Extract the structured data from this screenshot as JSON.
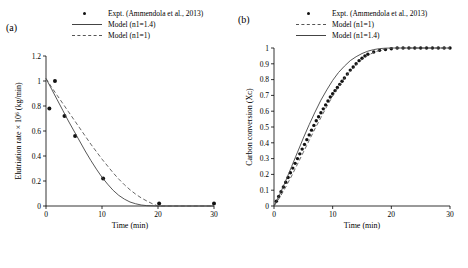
{
  "figure": {
    "panel_a_label": "(a)",
    "panel_b_label": "(b)"
  },
  "legend": {
    "expt": "Expt. (Ammendola et al., 2013)",
    "model_n14": "Model (n1=1.4)",
    "model_n1": "Model (n1=1)"
  },
  "colors": {
    "marker": "#111111",
    "solid_line": "#444444",
    "dashed_line": "#555555",
    "axis": "#000000"
  },
  "chart_data": [
    {
      "type": "line",
      "panel": "a",
      "title": "",
      "xlabel": "Time (min)",
      "ylabel": "Elutriation rate × 10⁶ (kg/min)",
      "xlim": [
        0,
        30
      ],
      "ylim": [
        0,
        1.2
      ],
      "xticks": [
        0,
        10,
        20,
        30
      ],
      "yticks": [
        0,
        0.2,
        0.4,
        0.6,
        0.8,
        1,
        1.2
      ],
      "ytick_labels": [
        "0",
        "0.2",
        "0.4",
        "0.6",
        "0.8",
        "1",
        "1.2"
      ],
      "grid": false,
      "legend_position": "top-center",
      "series": [
        {
          "name": "Expt. (Ammendola et al., 2013)",
          "style": "scatter",
          "x": [
            0.6,
            1.6,
            3.3,
            5.2,
            10.2,
            20.2,
            30.0
          ],
          "y": [
            0.78,
            1.0,
            0.72,
            0.56,
            0.22,
            0.02,
            0.02
          ]
        },
        {
          "name": "Model (n1=1.4)",
          "style": "solid",
          "x": [
            0,
            1,
            2,
            3,
            4,
            5,
            6,
            7,
            8,
            9,
            10,
            11,
            12,
            13,
            14,
            15,
            16,
            17,
            18,
            20,
            25,
            30
          ],
          "y": [
            1.02,
            0.935,
            0.85,
            0.765,
            0.68,
            0.6,
            0.52,
            0.44,
            0.365,
            0.295,
            0.23,
            0.175,
            0.125,
            0.085,
            0.055,
            0.032,
            0.018,
            0.008,
            0.003,
            0.0,
            0.0,
            0.0
          ]
        },
        {
          "name": "Model (n1=1)",
          "style": "dashed",
          "x": [
            0,
            1,
            2,
            3,
            4,
            5,
            6,
            7,
            8,
            9,
            10,
            11,
            12,
            13,
            14,
            15,
            16,
            17,
            18,
            19,
            20,
            25,
            30
          ],
          "y": [
            1.02,
            0.95,
            0.885,
            0.82,
            0.755,
            0.69,
            0.625,
            0.56,
            0.495,
            0.435,
            0.375,
            0.32,
            0.265,
            0.215,
            0.17,
            0.13,
            0.095,
            0.065,
            0.04,
            0.018,
            0.0,
            0.0,
            0.0
          ]
        }
      ]
    },
    {
      "type": "line",
      "panel": "b",
      "title": "",
      "xlabel": "Time (min)",
      "ylabel": "Carbon conversion (Xᴄ)",
      "xlim": [
        0,
        30
      ],
      "ylim": [
        0,
        1
      ],
      "xticks": [
        0,
        10,
        20,
        30
      ],
      "yticks": [
        0,
        0.1,
        0.2,
        0.3,
        0.4,
        0.5,
        0.6,
        0.7,
        0.8,
        0.9,
        1
      ],
      "ytick_labels": [
        "0",
        "0.1",
        "0.2",
        "0.3",
        "0.4",
        "0.5",
        "0.6",
        "0.7",
        "0.8",
        "0.9",
        "1"
      ],
      "grid": false,
      "legend_position": "top-center",
      "series": [
        {
          "name": "Expt. (Ammendola et al., 2013)",
          "style": "scatter",
          "x": [
            0.4,
            0.8,
            1.2,
            1.6,
            2.0,
            2.4,
            2.8,
            3.2,
            3.6,
            4.0,
            4.4,
            4.8,
            5.2,
            5.6,
            6.0,
            6.4,
            6.8,
            7.2,
            7.6,
            8.0,
            8.4,
            8.8,
            9.2,
            9.6,
            10.0,
            10.4,
            10.8,
            11.2,
            11.6,
            12.0,
            12.5,
            13.0,
            13.5,
            14.0,
            14.5,
            15.0,
            15.5,
            16.0,
            17.0,
            18.0,
            19.0,
            20.0,
            21.0,
            22.0,
            23.0,
            24.0,
            25.0,
            26.0,
            27.0,
            28.0,
            29.0,
            30.0
          ],
          "y": [
            0.03,
            0.06,
            0.09,
            0.12,
            0.15,
            0.18,
            0.21,
            0.24,
            0.27,
            0.3,
            0.33,
            0.36,
            0.39,
            0.42,
            0.45,
            0.48,
            0.51,
            0.54,
            0.565,
            0.59,
            0.615,
            0.64,
            0.665,
            0.69,
            0.71,
            0.73,
            0.75,
            0.77,
            0.79,
            0.81,
            0.835,
            0.86,
            0.88,
            0.9,
            0.92,
            0.935,
            0.95,
            0.96,
            0.975,
            0.985,
            0.99,
            0.995,
            1.0,
            1.0,
            1.0,
            1.0,
            1.0,
            1.0,
            1.0,
            1.0,
            1.0,
            1.0
          ]
        },
        {
          "name": "Model (n1=1.4)",
          "style": "solid",
          "x": [
            0,
            1,
            2,
            3,
            4,
            5,
            6,
            7,
            8,
            9,
            10,
            11,
            12,
            13,
            14,
            15,
            16,
            17,
            18,
            19,
            20,
            22,
            25,
            30
          ],
          "y": [
            0,
            0.075,
            0.16,
            0.25,
            0.34,
            0.43,
            0.515,
            0.595,
            0.67,
            0.735,
            0.795,
            0.845,
            0.885,
            0.92,
            0.945,
            0.965,
            0.98,
            0.99,
            0.996,
            0.999,
            1.0,
            1.0,
            1.0,
            1.0
          ]
        },
        {
          "name": "Model (n1=1)",
          "style": "dashed",
          "x": [
            0,
            1,
            2,
            3,
            4,
            5,
            6,
            7,
            8,
            9,
            10,
            11,
            12,
            13,
            14,
            15,
            16,
            17,
            18,
            19,
            20,
            22,
            25,
            30
          ],
          "y": [
            0,
            0.055,
            0.12,
            0.19,
            0.265,
            0.34,
            0.415,
            0.49,
            0.56,
            0.63,
            0.695,
            0.755,
            0.81,
            0.855,
            0.895,
            0.928,
            0.953,
            0.972,
            0.985,
            0.995,
            1.0,
            1.0,
            1.0,
            1.0
          ]
        }
      ]
    }
  ]
}
